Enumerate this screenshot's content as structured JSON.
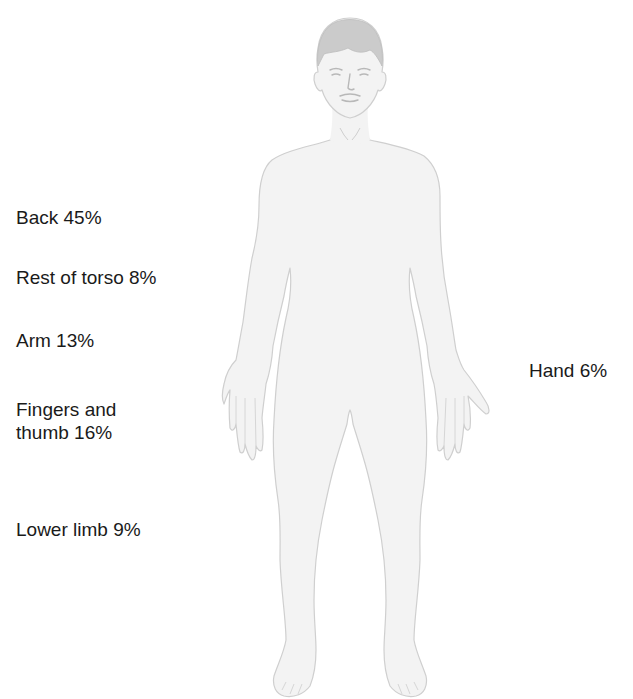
{
  "diagram": {
    "type": "body-map",
    "colors": {
      "body_fill": "#f3f3f3",
      "body_outline": "#cfcfcf",
      "hair": "#c8c8c8",
      "text": "#1a1a1a",
      "background": "#ffffff"
    }
  },
  "labels": [
    {
      "id": "back",
      "text": "Back 45%",
      "region": "Back",
      "percent": 45
    },
    {
      "id": "rest-of-torso",
      "text": "Rest of torso 8%",
      "region": "Rest of torso",
      "percent": 8
    },
    {
      "id": "arm",
      "text": "Arm 13%",
      "region": "Arm",
      "percent": 13
    },
    {
      "id": "fingers-thumb",
      "text": "Fingers and thumb 16%",
      "line1": "Fingers and",
      "line2": "thumb 16%",
      "region": "Fingers and thumb",
      "percent": 16
    },
    {
      "id": "lower-limb",
      "text": "Lower limb 9%",
      "region": "Lower limb",
      "percent": 9
    },
    {
      "id": "hand",
      "text": "Hand 6%",
      "region": "Hand",
      "percent": 6
    }
  ]
}
